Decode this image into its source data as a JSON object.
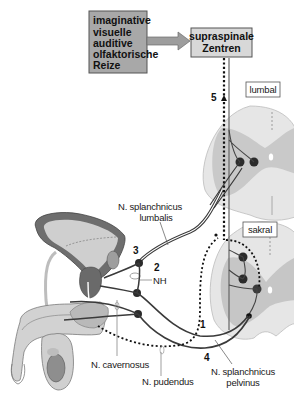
{
  "diagram": {
    "stimuli_box": {
      "lines": [
        "imaginative",
        "visuelle",
        "auditive",
        "olfaktorische",
        "Reize"
      ]
    },
    "supraspinal_box": {
      "lines": [
        "supraspinale",
        "Zentren"
      ]
    },
    "segment_labels": {
      "lumbal": "lumbal",
      "sakral": "sakral"
    },
    "pathway_numbers": {
      "p1": "1",
      "p2": "2",
      "p3": "3",
      "p4": "4",
      "p5": "5"
    },
    "nerve_labels": {
      "splanchnicus_lumbalis": [
        "N. splanchnicus",
        "lumbalis"
      ],
      "nh": "NH",
      "cavernosus": "N. cavernosus",
      "pudendus": "N. pudendus",
      "splanchnicus_pelvinus": [
        "N. splanchnicus",
        "pelvinus"
      ]
    },
    "colors": {
      "box_fill": "#a9a9a9",
      "supraspinal_fill": "#d6d6d6",
      "arrow_fill": "#9a9a9a",
      "spinal_white_matter": "#e4e4e4",
      "spinal_gray_matter": "#c8c8c8",
      "nerve_dark": "#3a3a3a",
      "neuron": "#2b2b2b",
      "organ_dark": "#6e6e6e",
      "organ_light": "#cfcfcf"
    }
  }
}
